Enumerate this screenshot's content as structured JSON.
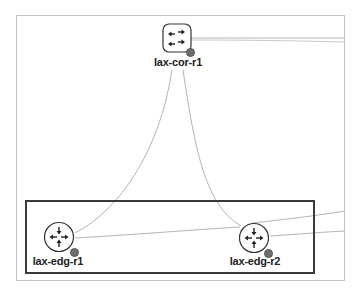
{
  "diagram": {
    "type": "network-topology",
    "colors": {
      "link": "#b5b5b5",
      "selection_border": "#3a3a3a",
      "panel_border": "#c4c4c4",
      "node_stroke": "#333333",
      "status_dot": "#6e6e6e",
      "label": "#222222"
    },
    "nodes": [
      {
        "id": "lax-cor-r1",
        "label": "lax-cor-r1",
        "kind": "core-switch",
        "icon": "switch-arrows-icon"
      },
      {
        "id": "lax-edg-r1",
        "label": "lax-edg-r1",
        "kind": "edge-router",
        "icon": "router-arrows-icon"
      },
      {
        "id": "lax-edg-r2",
        "label": "lax-edg-r2",
        "kind": "edge-router",
        "icon": "router-arrows-icon"
      }
    ],
    "links": [
      {
        "from": "lax-cor-r1",
        "to": "lax-edg-r1"
      },
      {
        "from": "lax-cor-r1",
        "to": "lax-edg-r2"
      },
      {
        "from": "lax-edg-r1",
        "to": "lax-edg-r2"
      },
      {
        "from": "lax-cor-r1",
        "to": "offscreen-right"
      },
      {
        "from": "lax-cor-r1",
        "to": "offscreen-right"
      },
      {
        "from": "lax-edg-r2",
        "to": "offscreen-right"
      },
      {
        "from": "lax-edg-r2",
        "to": "offscreen-right"
      }
    ],
    "selection": {
      "members": [
        "lax-edg-r1",
        "lax-edg-r2"
      ]
    }
  }
}
